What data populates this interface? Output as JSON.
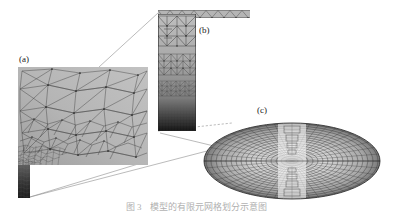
{
  "figure": {
    "type": "multiscale-finite-element-mesh",
    "background_color": "#ffffff",
    "caption": "图 3　模型的有限元网格划分示意图",
    "caption_visible_note": "cropped at bottom edge of image",
    "panels": [
      {
        "id": "a",
        "label": "(a)",
        "description": "graded unstructured triangular mesh block, coarse at upper-right refining toward lower-left",
        "fill_color": "#b9b9b9",
        "edge_color": "#3a3a3a"
      },
      {
        "id": "b",
        "label": "(b)",
        "description": "tall narrow column of graded triangular mesh, refining and darkening toward the bottom, with thin horizontal element strip extending to the right at top",
        "fill_color": "#a8a8a8",
        "edge_color": "#2f2f2f"
      },
      {
        "id": "c",
        "label": "(c)",
        "description": "elliptical disc shown in perspective with dense concentric radial ring mesh and a light vertical band of nested structures through the centre",
        "fill_color": "#d2d2d2",
        "edge_color": "#2b2b2b"
      }
    ],
    "leaders": [
      {
        "name": "a-to-b",
        "from_panel": "a",
        "to_panel": "b"
      },
      {
        "name": "a-to-c",
        "from_panel": "a",
        "to_panel": "c"
      },
      {
        "name": "b-to-c",
        "from_panel": "b",
        "to_panel": "c"
      }
    ]
  }
}
